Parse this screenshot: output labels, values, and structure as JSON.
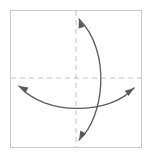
{
  "canvas": {
    "width": 148,
    "height": 158,
    "background": "#ffffff",
    "title": "Two crossing double-headed curved arrows on a dashed crosshair"
  },
  "frame": {
    "name": "bounding-box",
    "x": 10.5,
    "y": 10.5,
    "width": 131,
    "height": 137,
    "stroke": "#c9c9c9",
    "stroke_width": 1
  },
  "axes": {
    "stroke": "#c2c2c2",
    "stroke_width": 1,
    "dash_pattern": "5,4",
    "horizontal": {
      "name": "horizontal-dashed-axis",
      "y": 78,
      "x1": 11,
      "x2": 141
    },
    "vertical": {
      "name": "vertical-dashed-axis",
      "x": 76,
      "y1": 11,
      "y2": 147
    }
  },
  "curves": [
    {
      "id": "curve-vertical",
      "name": "vertical-double-arrow-curve",
      "orientation": "vertical",
      "stroke": "#5a5a5a",
      "stroke_width": 1.3,
      "arrowheads": "both",
      "start": {
        "x": 79,
        "y": 19
      },
      "end": {
        "x": 79,
        "y": 140
      },
      "control1": {
        "x": 112,
        "y": 52
      },
      "control2": {
        "x": 104,
        "y": 118
      },
      "bulge_extreme": {
        "x": 108,
        "y": 85
      }
    },
    {
      "id": "curve-horizontal",
      "name": "horizontal-double-arrow-curve",
      "orientation": "horizontal",
      "stroke": "#5a5a5a",
      "stroke_width": 1.3,
      "arrowheads": "both",
      "start": {
        "x": 19,
        "y": 86
      },
      "end": {
        "x": 134,
        "y": 88
      },
      "control1": {
        "x": 45,
        "y": 116
      },
      "control2": {
        "x": 110,
        "y": 115
      },
      "bulge_extreme": {
        "x": 78,
        "y": 111
      }
    }
  ],
  "arrowheads": [
    {
      "id": "arrow-top",
      "name": "arrowhead-top-left",
      "tip": {
        "x": 79,
        "y": 19
      },
      "direction": "up-left",
      "angle_deg": -107
    },
    {
      "id": "arrow-bottom",
      "name": "arrowhead-bottom-left",
      "tip": {
        "x": 79,
        "y": 140
      },
      "direction": "down-left",
      "angle_deg": 118
    },
    {
      "id": "arrow-left",
      "name": "arrowhead-left-up",
      "tip": {
        "x": 19,
        "y": 86
      },
      "direction": "up-left",
      "angle_deg": -152
    },
    {
      "id": "arrow-right",
      "name": "arrowhead-right-up",
      "tip": {
        "x": 134,
        "y": 88
      },
      "direction": "up-right",
      "angle_deg": -36
    }
  ],
  "intersection": {
    "name": "curve-crossing-point",
    "x": 97,
    "y": 107
  },
  "arrowhead_style": {
    "length": 9,
    "half_width": 3.2,
    "fill": "#5a5a5a"
  }
}
